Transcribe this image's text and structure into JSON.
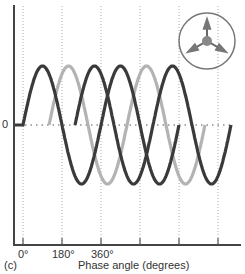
{
  "chart_data": {
    "type": "line",
    "title": "",
    "panel_label": "(c)",
    "xlabel": "Phase angle (degrees)",
    "ylabel": "",
    "y_zero_label": "0",
    "x_tick_labels": [
      "0°",
      "180°",
      "360°",
      "",
      "",
      ""
    ],
    "x_ticks_degrees": [
      0,
      180,
      360,
      540,
      720,
      900
    ],
    "grid": "vertical dotted at every 180°, horizontal dotted at zero",
    "series": [
      {
        "name": "phase-1",
        "color": "#3a3a3a",
        "start_deg": 0,
        "end_deg": 720,
        "amplitude": 1
      },
      {
        "name": "phase-2",
        "color": "#b3b3b3",
        "start_deg": 120,
        "end_deg": 840,
        "amplitude": 1
      },
      {
        "name": "phase-3",
        "color": "#3a3a3a",
        "start_deg": 240,
        "end_deg": 960,
        "amplitude": 1
      }
    ],
    "inset": {
      "type": "phasor-diagram",
      "vectors_deg": [
        90,
        210,
        330
      ],
      "description": "three arrows 120° apart inside a circle"
    }
  },
  "colors": {
    "axis": "#444444",
    "grid": "#aaaaaa",
    "dark_wave": "#3a3a3a",
    "light_wave": "#b3b3b3",
    "inset": "#777777"
  }
}
